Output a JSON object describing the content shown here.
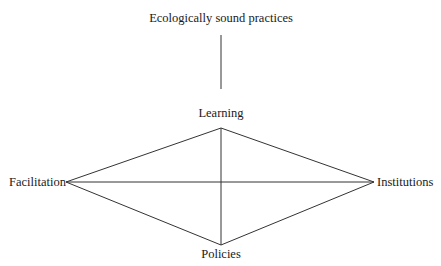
{
  "diagram": {
    "type": "diamond-network",
    "nodes": {
      "top": "Ecologically sound practices",
      "upper": "Learning",
      "left": "Facilitation",
      "right": "Institutions",
      "bottom": "Policies"
    },
    "edges": [
      [
        "Ecologically sound practices",
        "Learning"
      ],
      [
        "Learning",
        "Facilitation"
      ],
      [
        "Learning",
        "Institutions"
      ],
      [
        "Learning",
        "Policies"
      ],
      [
        "Facilitation",
        "Institutions"
      ],
      [
        "Facilitation",
        "Policies"
      ],
      [
        "Institutions",
        "Policies"
      ]
    ],
    "line_color": "#333333"
  }
}
